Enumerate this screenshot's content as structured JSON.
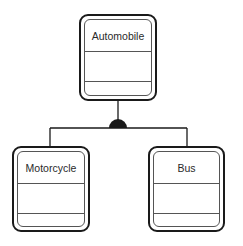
{
  "diagram": {
    "type": "class-inheritance",
    "parent": {
      "name": "Automobile",
      "attributes": [],
      "operations": []
    },
    "children": [
      {
        "name": "Motorcycle",
        "attributes": [],
        "operations": []
      },
      {
        "name": "Bus",
        "attributes": [],
        "operations": []
      }
    ],
    "connector": {
      "style": "tree",
      "junction": "filled-semicircle",
      "color": "#1a1a1a"
    }
  }
}
